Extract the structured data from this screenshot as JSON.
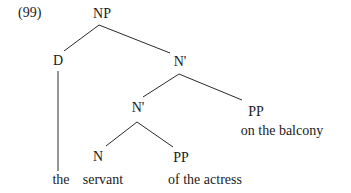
{
  "example_number": "(99)",
  "tree": {
    "nodes": {
      "np": "NP",
      "d": "D",
      "nbar_upper": "N'",
      "nbar_lower": "N'",
      "pp_balcony": "PP",
      "n": "N",
      "pp_actress": "PP"
    },
    "leaves": {
      "the": "the",
      "servant": "servant",
      "of_the_actress": "of the actress",
      "on_the_balcony": "on the balcony"
    },
    "edges": [
      [
        "NP",
        "D"
      ],
      [
        "NP",
        "N'"
      ],
      [
        "N'",
        "N'"
      ],
      [
        "N'",
        "PP"
      ],
      [
        "N'",
        "N"
      ],
      [
        "N'",
        "PP"
      ],
      [
        "D",
        "the"
      ],
      [
        "N",
        "servant"
      ],
      [
        "PP",
        "of the actress"
      ],
      [
        "PP",
        "on the balcony"
      ]
    ]
  }
}
